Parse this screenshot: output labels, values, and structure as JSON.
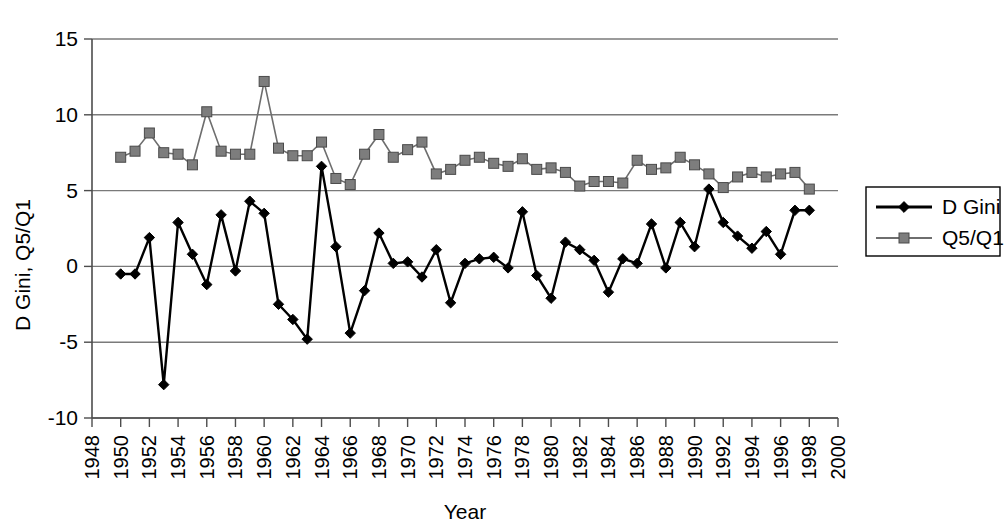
{
  "chart_data": {
    "type": "line",
    "title": "",
    "xlabel": "Year",
    "ylabel": "D Gini, Q5/Q1",
    "xlim": [
      1948,
      2000
    ],
    "ylim": [
      -10,
      15
    ],
    "xticks": [
      1948,
      1950,
      1952,
      1954,
      1956,
      1958,
      1960,
      1962,
      1964,
      1966,
      1968,
      1970,
      1972,
      1974,
      1976,
      1978,
      1980,
      1982,
      1984,
      1986,
      1988,
      1990,
      1992,
      1994,
      1996,
      1998,
      2000
    ],
    "yticks": [
      -10,
      -5,
      0,
      5,
      10,
      15
    ],
    "grid": "horizontal",
    "legend_position": "right-outside",
    "x": [
      1950,
      1951,
      1952,
      1953,
      1954,
      1955,
      1956,
      1957,
      1958,
      1959,
      1960,
      1961,
      1962,
      1963,
      1964,
      1965,
      1966,
      1967,
      1968,
      1969,
      1970,
      1971,
      1972,
      1973,
      1974,
      1975,
      1976,
      1977,
      1978,
      1979,
      1980,
      1981,
      1982,
      1983,
      1984,
      1985,
      1986,
      1987,
      1988,
      1989,
      1990,
      1991,
      1992,
      1993,
      1994,
      1995,
      1996,
      1997,
      1998
    ],
    "series": [
      {
        "name": "D Gini",
        "marker": "diamond",
        "color": "#000000",
        "values": [
          -0.5,
          -0.5,
          1.9,
          -7.8,
          2.9,
          0.8,
          -1.2,
          3.4,
          -0.3,
          4.3,
          3.5,
          -2.5,
          -3.5,
          -4.8,
          6.6,
          1.3,
          -4.4,
          -1.6,
          2.2,
          0.2,
          0.3,
          -0.7,
          1.1,
          -2.4,
          0.2,
          0.5,
          0.6,
          -0.1,
          3.6,
          -0.6,
          -2.1,
          1.6,
          1.1,
          0.4,
          -1.7,
          0.5,
          0.2,
          2.8,
          -0.1,
          2.9,
          1.3,
          5.1,
          2.9,
          2.0,
          1.2,
          2.3,
          0.8,
          3.7,
          3.7
        ]
      },
      {
        "name": "Q5/Q1",
        "marker": "square",
        "color": "#7d7d7d",
        "values": [
          7.2,
          7.6,
          8.8,
          7.5,
          7.4,
          6.7,
          10.2,
          7.6,
          7.4,
          7.4,
          12.2,
          7.8,
          7.3,
          7.3,
          8.2,
          5.8,
          5.4,
          7.4,
          8.7,
          7.2,
          7.7,
          8.2,
          6.1,
          6.4,
          7.0,
          7.2,
          6.8,
          6.6,
          7.1,
          6.4,
          6.5,
          6.2,
          5.3,
          5.6,
          5.6,
          5.5,
          7.0,
          6.4,
          6.5,
          7.2,
          6.7,
          6.1,
          5.2,
          5.9,
          6.2,
          5.9,
          6.1,
          6.2,
          5.1
        ]
      }
    ],
    "legend": [
      {
        "label": "D Gini",
        "marker": "diamond",
        "color": "#000000"
      },
      {
        "label": "Q5/Q1",
        "marker": "square",
        "color": "#7d7d7d"
      }
    ]
  },
  "colors": {
    "background": "#ffffff",
    "gridline": "#7a7a7a",
    "axis": "#4d4d4d",
    "dgini": "#000000",
    "q5q1": "#7d7d7d"
  }
}
